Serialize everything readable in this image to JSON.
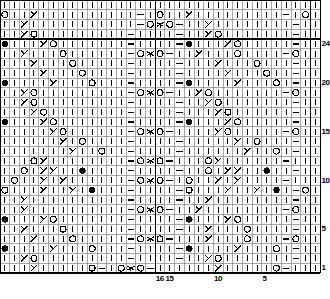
{
  "chart_title": "Knitting Stitch Chart",
  "chart_data": {
    "type": "table",
    "grid": {
      "columns": 33,
      "rows": 28,
      "cell_px": 9.7
    },
    "xlabel": "stitch number",
    "ylabel": "row number",
    "row_labels": [
      {
        "row": 24,
        "text": "24"
      },
      {
        "row": 20,
        "text": "20"
      },
      {
        "row": 15,
        "text": "15"
      },
      {
        "row": 10,
        "text": "10"
      },
      {
        "row": 5,
        "text": "5"
      },
      {
        "row": 1,
        "text": "1"
      }
    ],
    "col_labels": [
      {
        "col": 16,
        "text": "16"
      },
      {
        "col": 15,
        "text": "15"
      },
      {
        "col": 10,
        "text": "10"
      },
      {
        "col": 5,
        "text": "5"
      }
    ],
    "legend_symbols": [
      {
        "key": "k",
        "glyph": "|",
        "name": "knit"
      },
      {
        "key": "p",
        "glyph": "—",
        "name": "purl"
      },
      {
        "key": "yo",
        "glyph": "O",
        "name": "yarn-over"
      },
      {
        "key": "ssk",
        "glyph": "╱",
        "name": "left-leaning-decrease"
      },
      {
        "key": "k2tog",
        "glyph": "╲",
        "name": "right-leaning-decrease"
      },
      {
        "key": "cdd",
        "glyph": "⋏",
        "name": "double-decrease"
      },
      {
        "key": "bob",
        "glyph": "●",
        "name": "bobble"
      }
    ],
    "colors": {
      "ink": "#000000",
      "grid_line": "#808080",
      "heavy_line": "#000000",
      "background": "#ffffff"
    },
    "cells": [
      "k k k k k k k k k k k k k k k k k k k k k k k k k k k k k k k k k",
      "yo k k ssk k k k k k k k k k k p k yo k k ssk k k k k k k k k k p k yo",
      "k k ssk k k k k k k k k k k k p yo cdd yo p k k ssk k k k k k k k k p k",
      "k k ssk yo k k k k k k k k k p k k k k p k k ssk yo k k k k k k k p k",
      "bob k k k ssk yo k k k k k k k p k k k k p bob k k k ssk yo k k k k k p k",
      "k k ssk k k k yo k k k k k k p yo cdd yo p k k ssk k k k yo k k k k p yo",
      "k k k ssk k k k yo k k k k k p k k k k p k k k ssk k k k yo k k k p k",
      "k k k k ssk k k k yo k k k k p k k k k p k k k k ssk k k k yo k k p k",
      "bob k k k k ssk k k k yo k k k p k k k k p bob k k k k ssk k k k yo k p k",
      "k k ssk yo k k k k k k k k k p yo cdd yo p k k ssk yo k k k k k k k p yo",
      "k k ssk yo k k k k k k k k k p k k k k p k k ssk yo k k k k k k k p k",
      "k k k ssk yo k k k k k k k k p k k k k p k k k ssk yo k k k k k k p k",
      "bob k k k ssk yo k k k k k k k p k k k k p bob k k k ssk yo k k k k k p k",
      "k k k k k ssk yo k k k k k k p yo cdd yo p k k k k ssk yo k k k k k p yo",
      "k k k k k k ssk k yo k k k k p k k k k p k k k k k ssk k yo k k k p k",
      "k k k k k k k ssk k k yo k k p k k k k p k k k k k k ssk k k yo k p k",
      "k k k yo ssk k k k k k k k k p yo cdd yo p k k k yo ssk k k k k k k p k",
      "k k yo k ssk ssk k k bob k k k k p k k k k p k k yo k ssk ssk k k bob k k p k",
      "k yo k k ssk k ssk k k k k k k p yo cdd yo p k yo k k ssk k ssk k k k k p k",
      "yo k k k ssk k k ssk k bob k k k p k k k k p yo k k k ssk k k ssk k bob k p yo",
      "k k ssk k k k k k k k k k k p k k k k p k k ssk k k k k k k k k p k",
      "k k ssk k k k k k k k k k k p yo cdd yo p k k ssk k k k k k k k k p yo",
      "bob k k k ssk yo k k k k k k k p k k k k p bob k k k ssk yo k k k k k p k",
      "k k ssk k k k yo k k k k k k p k k k k p k k ssk k k k yo k k k k p k",
      "k k k ssk k k k yo k k k k k p yo cdd yo p k k k ssk k k k yo k k k p yo",
      "bob k k k k ssk k k k yo k k k p k k k k p bob k k k k ssk k k k yo k p k",
      "k k ssk yo k k k k k k k k k p k k k k p k k ssk yo k k k k k k k p k",
      "k k k ssk k k k k k yo p k yo cdd yo p k k k k k k ssk k k k k k yo p k"
    ]
  }
}
